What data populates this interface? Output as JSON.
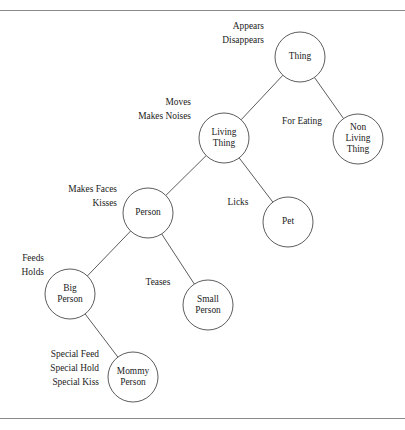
{
  "figure": {
    "kind": "node-link-hierarchy-diagram",
    "width": 405,
    "height": 430,
    "background_color": "#ffffff",
    "line_color": "#4a4a4a",
    "text_color": "#222222",
    "rule_color": "#8a8a8a",
    "node_radius": 25
  },
  "nodes": [
    {
      "id": "thing",
      "label_lines": [
        "Thing"
      ],
      "cx": 300,
      "cy": 57
    },
    {
      "id": "living-thing",
      "label_lines": [
        "Living",
        "Thing"
      ],
      "cx": 224,
      "cy": 138
    },
    {
      "id": "non-living-thing",
      "label_lines": [
        "Non",
        "Living",
        "Thing"
      ],
      "cx": 358,
      "cy": 139
    },
    {
      "id": "person",
      "label_lines": [
        "Person"
      ],
      "cx": 148,
      "cy": 213
    },
    {
      "id": "pet",
      "label_lines": [
        "Pet"
      ],
      "cx": 288,
      "cy": 222
    },
    {
      "id": "big-person",
      "label_lines": [
        "Big",
        "Person"
      ],
      "cx": 70,
      "cy": 294
    },
    {
      "id": "small-person",
      "label_lines": [
        "Small",
        "Person"
      ],
      "cx": 208,
      "cy": 305
    },
    {
      "id": "mommy-person",
      "label_lines": [
        "Mommy",
        "Person"
      ],
      "cx": 133,
      "cy": 377
    }
  ],
  "edges": [
    {
      "id": "thing-living-thing",
      "from": "thing",
      "to": "living-thing"
    },
    {
      "id": "thing-non-living-thing",
      "from": "thing",
      "to": "non-living-thing"
    },
    {
      "id": "living-thing-person",
      "from": "living-thing",
      "to": "person"
    },
    {
      "id": "living-thing-pet",
      "from": "living-thing",
      "to": "pet"
    },
    {
      "id": "person-big-person",
      "from": "person",
      "to": "big-person"
    },
    {
      "id": "person-small-person",
      "from": "person",
      "to": "small-person"
    },
    {
      "id": "big-person-mommy-person",
      "from": "big-person",
      "to": "mommy-person"
    }
  ],
  "feature_labels": [
    {
      "id": "thing-features",
      "for_node": "thing",
      "lines": [
        "Appears",
        "Disappears"
      ],
      "x": 264,
      "y": 27,
      "align": "end"
    },
    {
      "id": "living-thing-features",
      "for_node": "living-thing",
      "lines": [
        "Moves",
        "Makes Noises"
      ],
      "x": 191,
      "y": 103,
      "align": "end"
    },
    {
      "id": "non-living-thing-features",
      "for_node": "non-living-thing",
      "lines": [
        "For Eating"
      ],
      "x": 302,
      "y": 122,
      "align": "middle"
    },
    {
      "id": "person-features",
      "for_node": "person",
      "lines": [
        "Makes Faces",
        "Kisses"
      ],
      "x": 117,
      "y": 190,
      "align": "end"
    },
    {
      "id": "pet-features",
      "for_node": "pet",
      "lines": [
        "Licks"
      ],
      "x": 238,
      "y": 203,
      "align": "middle"
    },
    {
      "id": "big-person-features",
      "for_node": "big-person",
      "lines": [
        "Feeds",
        "Holds"
      ],
      "x": 44,
      "y": 259,
      "align": "end"
    },
    {
      "id": "small-person-features",
      "for_node": "small-person",
      "lines": [
        "Teases"
      ],
      "x": 158,
      "y": 283,
      "align": "middle"
    },
    {
      "id": "mommy-person-features",
      "for_node": "mommy-person",
      "lines": [
        "Special Feed",
        "Special Hold",
        "Special Kiss"
      ],
      "x": 99,
      "y": 355,
      "align": "end"
    }
  ]
}
